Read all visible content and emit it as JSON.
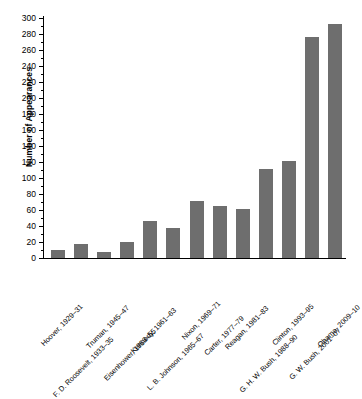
{
  "chart_data": {
    "type": "bar",
    "title": "",
    "subtitle": "",
    "xlabel": "",
    "ylabel": "Number of Appearances",
    "ylim": [
      0,
      300
    ],
    "ytick_step": 20,
    "yminor_step": 10,
    "grid": false,
    "legend": false,
    "bar_color": "#6e6e6e",
    "axis_color": "#000000",
    "orientation": "vertical",
    "xtick_rotation": -45,
    "categories": [
      "Hoover, 1929–31",
      "F. D. Roosevelt, 1933–35",
      "Truman, 1945–47",
      "Eisenhower, 1953–55",
      "Kennedy, 1961–63",
      "L. B. Johnson, 1965–67",
      "Nixon, 1969–71",
      "Carter, 1977–79",
      "Reagan, 1981–83",
      "G. H. W. Bush, 1988–90",
      "Clinton, 1993–95",
      "G. W. Bush, 2001–07",
      "Obama, 2009–10"
    ],
    "values": [
      10,
      17,
      8,
      20,
      46,
      38,
      71,
      65,
      61,
      111,
      121,
      276,
      292
    ],
    "ytick_labels": [
      "0",
      "20",
      "40",
      "60",
      "80",
      "100",
      "120",
      "140",
      "160",
      "180",
      "200",
      "220",
      "240",
      "260",
      "280",
      "300"
    ],
    "ytick_values": [
      0,
      20,
      40,
      60,
      80,
      100,
      120,
      140,
      160,
      180,
      200,
      220,
      240,
      260,
      280,
      300
    ]
  }
}
